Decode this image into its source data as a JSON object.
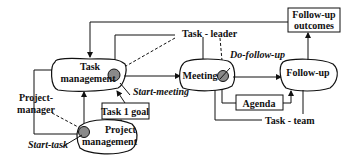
{
  "diagram": {
    "nodes": {
      "task_management": {
        "line1": "Task",
        "line2": "management"
      },
      "meeting": {
        "label": "Meeting"
      },
      "follow_up": {
        "label": "Follow-up"
      },
      "project_management": {
        "line1": "Project",
        "line2": "management"
      }
    },
    "boxes": {
      "follow_up_outcomes": {
        "line1": "Follow-up",
        "line2": "outcomes"
      },
      "task1_goal": {
        "label": "Task 1 goal"
      },
      "agenda": {
        "label": "Agenda"
      }
    },
    "roles": {
      "task_leader": "Task - leader",
      "task_team": "Task - team",
      "project_manager_line1": "Project-",
      "project_manager_line2": "manager"
    },
    "triggers": {
      "start_meeting": "Start-meeting",
      "do_follow_up": "Do-follow-up",
      "start_task": "Start-task"
    },
    "colors": {
      "stroke": "#111111",
      "trigger_fill": "#8a8a8a",
      "background": "#ffffff"
    }
  }
}
